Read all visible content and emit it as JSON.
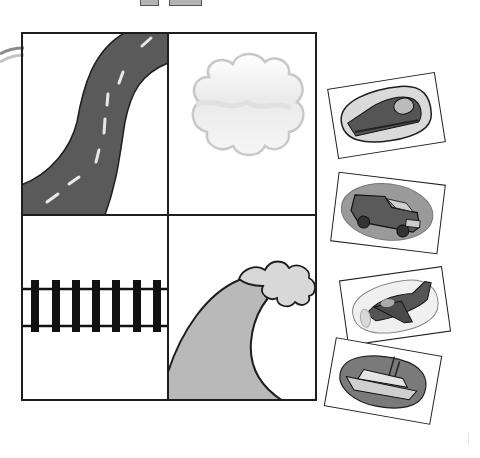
{
  "worksheet": {
    "title": "",
    "grid": {
      "cells": [
        {
          "id": "road",
          "label": "road",
          "fill": "#5a5a5a"
        },
        {
          "id": "sky",
          "label": "cloud",
          "fill": "#f2f2f2"
        },
        {
          "id": "rail",
          "label": "railroad tracks",
          "fill": "#111111"
        },
        {
          "id": "water",
          "label": "wave",
          "fill": "#b9b9b9"
        }
      ]
    },
    "cards": [
      {
        "id": "train",
        "label": "train",
        "rotation": -9
      },
      {
        "id": "truck",
        "label": "truck",
        "rotation": 7
      },
      {
        "id": "plane",
        "label": "airplane",
        "rotation": -8
      },
      {
        "id": "boat",
        "label": "boat",
        "rotation": 10
      }
    ],
    "colors": {
      "outline": "#1e1e1e",
      "road": "#5a5a5a",
      "dash": "#e8e8e8",
      "wave": "#b9b9b9",
      "foam": "#d8d8d8",
      "cloud_edge": "#c8c8c8"
    }
  }
}
